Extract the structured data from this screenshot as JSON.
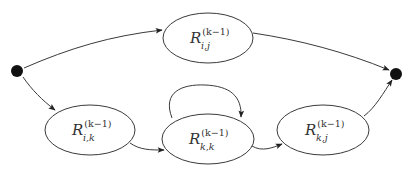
{
  "diagram": {
    "type": "state-elimination graph",
    "nodes": [
      {
        "id": "start",
        "kind": "terminal"
      },
      {
        "id": "Rij",
        "kind": "state",
        "label": {
          "base": "R",
          "superscript": "(k−1)",
          "subscript": "i,j"
        }
      },
      {
        "id": "Rik",
        "kind": "state",
        "label": {
          "base": "R",
          "superscript": "(k−1)",
          "subscript": "i,k"
        }
      },
      {
        "id": "Rkk",
        "kind": "state",
        "label": {
          "base": "R",
          "superscript": "(k−1)",
          "subscript": "k,k"
        }
      },
      {
        "id": "Rkj",
        "kind": "state",
        "label": {
          "base": "R",
          "superscript": "(k−1)",
          "subscript": "k,j"
        }
      },
      {
        "id": "end",
        "kind": "terminal"
      }
    ],
    "edges": [
      {
        "from": "start",
        "to": "Rij"
      },
      {
        "from": "Rij",
        "to": "end"
      },
      {
        "from": "start",
        "to": "Rik"
      },
      {
        "from": "Rik",
        "to": "Rkk"
      },
      {
        "from": "Rkk",
        "to": "Rkk",
        "self_loop": true
      },
      {
        "from": "Rkk",
        "to": "Rkj"
      },
      {
        "from": "Rkj",
        "to": "end"
      }
    ]
  }
}
